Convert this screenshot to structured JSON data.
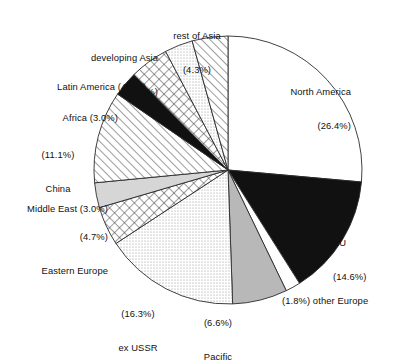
{
  "chart_data": {
    "type": "pie",
    "title": "",
    "subtitle": "",
    "xlabel": "",
    "ylabel": "",
    "legend_position": "none",
    "grid": false,
    "units": "percent",
    "start_angle_deg": 0,
    "direction": "clockwise",
    "categories": [
      "North America",
      "EU",
      "other Europe",
      "Pacific",
      "ex USSR",
      "Eastern Europe",
      "Middle East",
      "China",
      "Africa",
      "Latin America",
      "developing Asia",
      "rest of Asia"
    ],
    "values": [
      26.4,
      14.6,
      1.8,
      6.6,
      16.3,
      4.7,
      3.0,
      11.1,
      3.0,
      4.7,
      3.4,
      4.3
    ],
    "slices": [
      {
        "name": "North America",
        "value": 26.4,
        "fill": "white",
        "label_text": "North America\n(26.4%)"
      },
      {
        "name": "EU",
        "value": 14.6,
        "fill": "black",
        "label_text": "EU\n(14.6%)"
      },
      {
        "name": "other Europe",
        "value": 1.8,
        "fill": "white",
        "label_text": "(1.8%) other Europe"
      },
      {
        "name": "Pacific",
        "value": 6.6,
        "fill": "gray",
        "label_text": "(6.6%)\nPacific"
      },
      {
        "name": "ex USSR",
        "value": 16.3,
        "fill": "dots-light",
        "label_text": "(16.3%)\nex USSR"
      },
      {
        "name": "Eastern Europe",
        "value": 4.7,
        "fill": "crosshatch",
        "label_text": "(4.7%)\nEastern Europe"
      },
      {
        "name": "Middle East",
        "value": 3.0,
        "fill": "gray-light",
        "label_text": "Middle East (3.0%)"
      },
      {
        "name": "China",
        "value": 11.1,
        "fill": "hatch",
        "label_text": "(11.1%)\nChina"
      },
      {
        "name": "Africa",
        "value": 3.0,
        "fill": "black",
        "label_text": "Africa (3.0%)"
      },
      {
        "name": "Latin America",
        "value": 4.7,
        "fill": "crosshatch",
        "label_text": "Latin America (4.7%)"
      },
      {
        "name": "developing Asia",
        "value": 3.4,
        "fill": "dots-light",
        "label_text": "developing Asia\n(3.4%)"
      },
      {
        "name": "rest of Asia",
        "value": 4.3,
        "fill": "hatch",
        "label_text": "rest of Asia\n(4.3%)"
      }
    ]
  },
  "labels": {
    "north_america": "North America",
    "north_america_pct": "(26.4%)",
    "eu": "EU",
    "eu_pct": "(14.6%)",
    "other_europe": "(1.8%) other Europe",
    "pacific_pct": "(6.6%)",
    "pacific": "Pacific",
    "ex_ussr_pct": "(16.3%)",
    "ex_ussr": "ex USSR",
    "eastern_europe_pct": "(4.7%)",
    "eastern_europe": "Eastern Europe",
    "middle_east": "Middle East (3.0%)",
    "china_pct": "(11.1%)",
    "china": "China",
    "africa": "Africa (3.0%)",
    "latin_america": "Latin America (4.7%)",
    "developing_asia": "developing Asia",
    "developing_asia_pct": "(3.4%)",
    "rest_of_asia": "rest of Asia",
    "rest_of_asia_pct": "(4.3%)"
  },
  "colors": {
    "outline": "#2b2b2b",
    "black_fill": "#111111",
    "gray_fill": "#b8b8b8",
    "gray_light_fill": "#d6d6d6",
    "white_fill": "#ffffff",
    "text": "#111111",
    "background": "#ffffff"
  }
}
